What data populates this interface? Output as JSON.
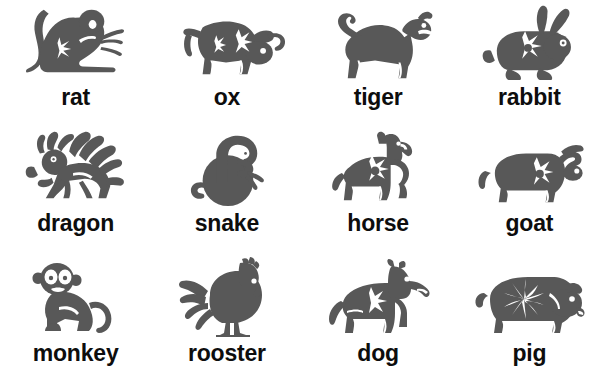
{
  "page": {
    "background_color": "#ffffff",
    "silhouette_color": "#585858",
    "label_color": "#0d0d0d",
    "grid": {
      "columns": 4,
      "rows": 3
    }
  },
  "animals": [
    {
      "label": "rat",
      "icon": "rat-silhouette-icon",
      "row": 1,
      "column": 1
    },
    {
      "label": "ox",
      "icon": "ox-silhouette-icon",
      "row": 1,
      "column": 2
    },
    {
      "label": "tiger",
      "icon": "tiger-silhouette-icon",
      "row": 1,
      "column": 3
    },
    {
      "label": "rabbit",
      "icon": "rabbit-silhouette-icon",
      "row": 1,
      "column": 4
    },
    {
      "label": "dragon",
      "icon": "dragon-silhouette-icon",
      "row": 2,
      "column": 1
    },
    {
      "label": "snake",
      "icon": "snake-silhouette-icon",
      "row": 2,
      "column": 2
    },
    {
      "label": "horse",
      "icon": "horse-silhouette-icon",
      "row": 2,
      "column": 3
    },
    {
      "label": "goat",
      "icon": "goat-silhouette-icon",
      "row": 2,
      "column": 4
    },
    {
      "label": "monkey",
      "icon": "monkey-silhouette-icon",
      "row": 3,
      "column": 1
    },
    {
      "label": "rooster",
      "icon": "rooster-silhouette-icon",
      "row": 3,
      "column": 2
    },
    {
      "label": "dog",
      "icon": "dog-silhouette-icon",
      "row": 3,
      "column": 3
    },
    {
      "label": "pig",
      "icon": "pig-silhouette-icon",
      "row": 3,
      "column": 4
    }
  ]
}
